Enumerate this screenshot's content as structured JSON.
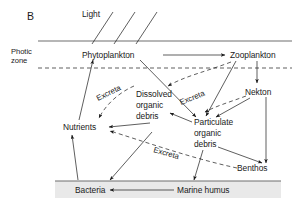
{
  "figure": {
    "panel_label": "B",
    "title_text": "",
    "zone_label_line1": "Photic",
    "zone_label_line2": "zone"
  },
  "colors": {
    "ink": "#1a1a1a",
    "band_line": "#6f6f6f",
    "sediment_fill": "#e9e9e9",
    "background": "#ffffff"
  },
  "nodes": {
    "light": "Light",
    "phytoplankton": "Phytoplankton",
    "zooplankton": "Zooplankton",
    "nekton": "Nekton",
    "nutrients": "Nutrients",
    "dissolved_organic_debris_l1": "Dissolved",
    "dissolved_organic_debris_l2": "organic",
    "dissolved_organic_debris_l3": "debris",
    "particulate_organic_debris_l1": "Particulate",
    "particulate_organic_debris_l2": "organic",
    "particulate_organic_debris_l3": "debris",
    "benthos": "Benthos",
    "bacteria": "Bacteria",
    "marine_humus": "Marine humus"
  },
  "flow_labels": {
    "excreta_upper_left": "Excreta",
    "excreta_upper_right": "Excreta",
    "excreta_lower": "Excreta"
  }
}
